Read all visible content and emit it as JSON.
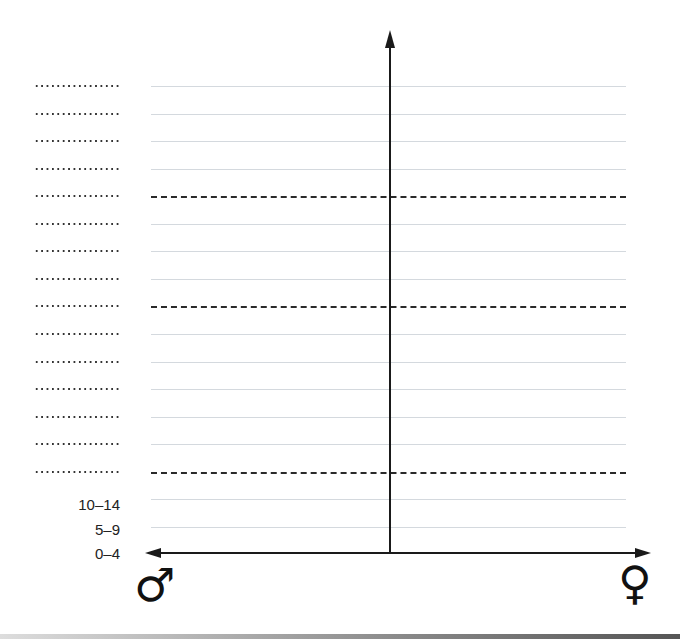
{
  "title_clipped": "[Table 2.x] Pyramid diagram",
  "age_labels": [
    "",
    "",
    "",
    "",
    "",
    "",
    "",
    "",
    "",
    "",
    "",
    "",
    "",
    "",
    "",
    "10–14",
    "5–9",
    "0–4"
  ],
  "dashed_rows": [
    4,
    8,
    14
  ],
  "left_symbol": "♂",
  "right_symbol": "♀",
  "left_symbol_name": "male",
  "right_symbol_name": "female"
}
